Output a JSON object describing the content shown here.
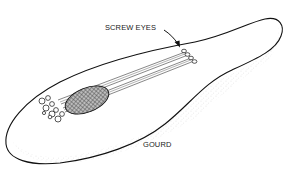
{
  "diagram": {
    "labels": {
      "screw_eyes": "SCREW EYES",
      "gourd": "GOURD"
    },
    "colors": {
      "line": "#111111",
      "stipple": "#9a9a9a",
      "background": "#ffffff"
    },
    "string_count": 4
  }
}
